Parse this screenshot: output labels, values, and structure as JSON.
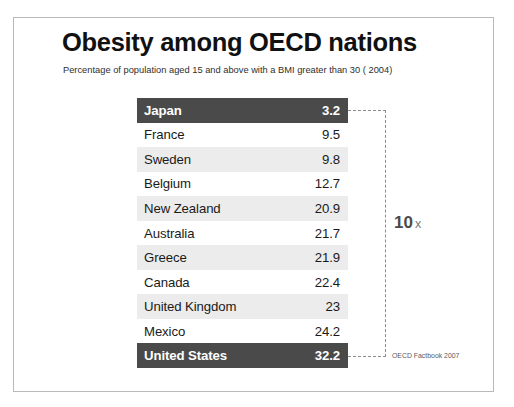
{
  "chart_data": {
    "type": "table",
    "title": "Obesity among OECD nations",
    "subtitle": "Percentage of population aged 15 and above with a BMI greater than 30 ( 2004)",
    "xlabel": "",
    "ylabel": "",
    "categories": [
      "Japan",
      "France",
      "Sweden",
      "Belgium",
      "New Zealand",
      "Australia",
      "Greece",
      "Canada",
      "United Kingdom",
      "Mexico",
      "United States"
    ],
    "values": [
      3.2,
      9.5,
      9.8,
      12.7,
      20.9,
      21.7,
      21.9,
      22.4,
      23,
      24.2,
      32.2
    ],
    "rows": [
      {
        "country": "Japan",
        "value": "3.2",
        "style": "highlight"
      },
      {
        "country": "France",
        "value": "9.5",
        "style": "plain"
      },
      {
        "country": "Sweden",
        "value": "9.8",
        "style": "stripe"
      },
      {
        "country": "Belgium",
        "value": "12.7",
        "style": "plain"
      },
      {
        "country": "New Zealand",
        "value": "20.9",
        "style": "stripe"
      },
      {
        "country": "Australia",
        "value": "21.7",
        "style": "plain"
      },
      {
        "country": "Greece",
        "value": "21.9",
        "style": "stripe"
      },
      {
        "country": "Canada",
        "value": "22.4",
        "style": "plain"
      },
      {
        "country": "United Kingdom",
        "value": "23",
        "style": "stripe"
      },
      {
        "country": "Mexico",
        "value": "24.2",
        "style": "plain"
      },
      {
        "country": "United States",
        "value": "32.2",
        "style": "highlight"
      }
    ],
    "annotation": {
      "number": "10",
      "symbol": "x"
    },
    "source": "OECD Factbook 2007",
    "colors": {
      "highlight_bar": "#4a4a4a",
      "stripe": "#ececec",
      "background": "#ffffff",
      "frame_border": "#b9b9b9",
      "bracket": "#8c8c8c"
    }
  }
}
